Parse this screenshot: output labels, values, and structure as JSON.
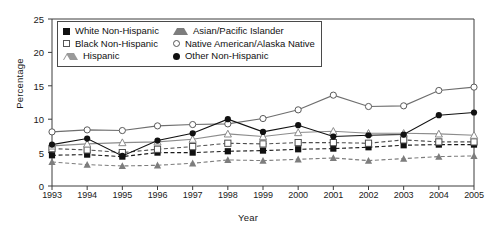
{
  "chart_data": {
    "type": "line",
    "title": "",
    "xlabel": "Year",
    "ylabel": "Percentage",
    "categories": [
      "1993",
      "1994",
      "1995",
      "1996",
      "1997",
      "1998",
      "1999",
      "2000",
      "2001",
      "2002",
      "2003",
      "2004",
      "2005"
    ],
    "x": [
      1993,
      1994,
      1995,
      1996,
      1997,
      1998,
      1999,
      2000,
      2001,
      2002,
      2003,
      2004,
      2005
    ],
    "xlim": [
      1993,
      2005
    ],
    "ylim": [
      0,
      25
    ],
    "yticks": [
      0,
      5,
      10,
      15,
      20,
      25
    ],
    "grid": false,
    "legend_position": "top-left-inside",
    "series": [
      {
        "name": "White Non-Hispanic",
        "marker": "filled-square",
        "line": "dashed",
        "color": "#1a1a1a",
        "values": [
          4.6,
          4.7,
          4.4,
          5.0,
          5.0,
          5.2,
          5.3,
          5.5,
          5.6,
          5.8,
          6.1,
          6.2,
          6.2
        ]
      },
      {
        "name": "Black Non-Hispanic",
        "marker": "open-square",
        "line": "dashed",
        "color": "#4d4d4d",
        "values": [
          5.6,
          5.4,
          5.0,
          5.5,
          5.9,
          6.4,
          6.3,
          6.5,
          6.5,
          6.4,
          6.9,
          6.6,
          6.6
        ]
      },
      {
        "name": "Hispanic",
        "marker": "open-triangle",
        "line": "solid",
        "color": "#8c8c8c",
        "values": [
          6.0,
          6.3,
          6.5,
          6.6,
          7.0,
          7.8,
          7.4,
          8.0,
          8.2,
          7.9,
          7.9,
          7.8,
          7.6
        ]
      },
      {
        "name": "Asian/Pacific Islander",
        "marker": "filled-triangle",
        "line": "dashed",
        "color": "#7d7d7d",
        "values": [
          3.6,
          3.2,
          3.0,
          3.1,
          3.4,
          3.9,
          3.8,
          4.0,
          4.2,
          3.8,
          4.1,
          4.4,
          4.5
        ]
      },
      {
        "name": "Native American/Alaska Native",
        "marker": "open-circle",
        "line": "solid",
        "color": "#6e6e6e",
        "values": [
          8.1,
          8.4,
          8.3,
          9.0,
          9.2,
          9.3,
          10.1,
          11.4,
          13.6,
          11.9,
          12.0,
          14.3,
          14.8
        ]
      },
      {
        "name": "Other Non-Hispanic",
        "marker": "filled-circle",
        "line": "solid",
        "color": "#111111",
        "values": [
          6.2,
          7.1,
          4.5,
          6.8,
          7.9,
          10.0,
          8.1,
          9.1,
          7.4,
          7.6,
          7.7,
          10.6,
          11.0
        ]
      }
    ]
  },
  "axes": {
    "ylabel": "Percentage",
    "xlabel": "Year"
  },
  "legend": {
    "items": [
      {
        "label": "White Non-Hispanic",
        "marker": "filled-square"
      },
      {
        "label": "Asian/Pacific Islander",
        "marker": "filled-triangle"
      },
      {
        "label": "Black Non-Hispanic",
        "marker": "open-square"
      },
      {
        "label": "Native American/Alaska Native",
        "marker": "open-circle"
      },
      {
        "label": "Hispanic",
        "marker": "open-triangle"
      },
      {
        "label": "Other Non-Hispanic",
        "marker": "filled-circle"
      }
    ]
  }
}
